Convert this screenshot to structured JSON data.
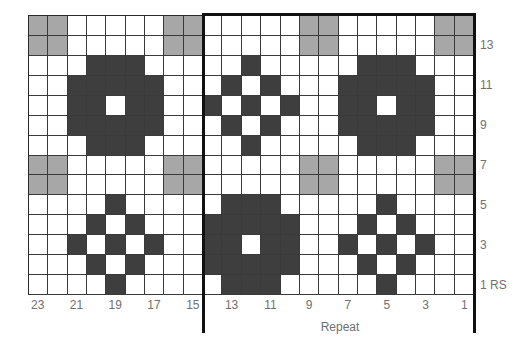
{
  "chart": {
    "title": "",
    "columns": 23,
    "rows": 14,
    "legend_colors": {
      "white": "#ffffff",
      "gray": "#a7a7a7",
      "dark": "#3e3e3e",
      "border": "#111111"
    },
    "repeat_label": "Repeat",
    "repeat_columns": {
      "from_stitch": 14,
      "to_stitch": 1
    },
    "column_labels": [
      {
        "stitch": 23,
        "label": "23"
      },
      {
        "stitch": 21,
        "label": "21"
      },
      {
        "stitch": 19,
        "label": "19"
      },
      {
        "stitch": 17,
        "label": "17"
      },
      {
        "stitch": 15,
        "label": "15"
      },
      {
        "stitch": 13,
        "label": "13"
      },
      {
        "stitch": 11,
        "label": "11"
      },
      {
        "stitch": 9,
        "label": "9"
      },
      {
        "stitch": 7,
        "label": "7"
      },
      {
        "stitch": 5,
        "label": "5"
      },
      {
        "stitch": 3,
        "label": "3"
      },
      {
        "stitch": 1,
        "label": "1"
      }
    ],
    "row_labels": [
      {
        "row": 13,
        "label": "13"
      },
      {
        "row": 11,
        "label": "11"
      },
      {
        "row": 9,
        "label": "9"
      },
      {
        "row": 7,
        "label": "7"
      },
      {
        "row": 5,
        "label": "5"
      },
      {
        "row": 3,
        "label": "3"
      },
      {
        "row": 1,
        "label": "1 RS"
      }
    ],
    "grid_rows_top_to_bottom": [
      "GG.....GG.....GG.....GG",
      "GG.....GG.....GG.....GG",
      "...DDD.....D.....DDD...",
      "..DDDDD...D.D...DDDDD..",
      "..DD.DD..D.D.D..DD.DD..",
      "..DDDDD...D.D...DDDDD..",
      "...DDD.....D.....DDD...",
      "GG.....GG.....GG.....GG",
      "GG.....GG.....GG.....GG",
      "....D.....DDD.....D....",
      "...D.D...DDDDD...D.D...",
      "..D.D.D..DD.DD..D.D.D..",
      "...D.D...DDDDD...D.D...",
      "....D.....DDD.....D...."
    ]
  }
}
